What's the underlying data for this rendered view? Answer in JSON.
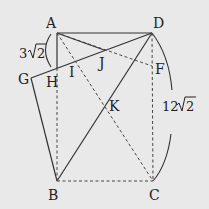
{
  "diagram": {
    "type": "geometry-figure",
    "points": {
      "A": "A",
      "B": "B",
      "C": "C",
      "D": "D",
      "F": "F",
      "G": "G",
      "H": "H",
      "I": "I",
      "J": "J",
      "K": "K"
    },
    "measurements": {
      "left": {
        "coef": "3",
        "radicand": "2",
        "segment": "AH"
      },
      "right": {
        "coef": "12",
        "radicand": "2",
        "segment": "DC"
      }
    },
    "solid_segments": [
      "AD",
      "AH",
      "GD",
      "GB",
      "AJ",
      "BD"
    ],
    "dashed_segments": [
      "HB",
      "BC",
      "DC",
      "AC",
      "AF"
    ]
  }
}
